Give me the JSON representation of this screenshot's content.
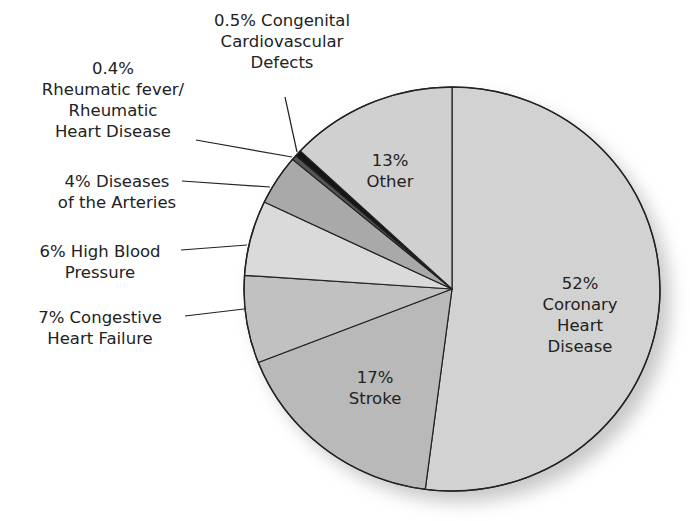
{
  "chart_data": {
    "type": "pie",
    "title": "",
    "start_angle_deg": 0,
    "direction": "clockwise",
    "slices": [
      {
        "label": "Coronary Heart Disease",
        "value": 52,
        "display": "52%",
        "color": "#d2d2d2"
      },
      {
        "label": "Stroke",
        "value": 17,
        "display": "17%",
        "color": "#b9b9b9"
      },
      {
        "label": "Congestive Heart Failure",
        "value": 7,
        "display": "7%",
        "color": "#c1c1c1"
      },
      {
        "label": "High Blood Pressure",
        "value": 6,
        "display": "6%",
        "color": "#dadada"
      },
      {
        "label": "Diseases of the Arteries",
        "value": 4,
        "display": "4%",
        "color": "#a9a9a9"
      },
      {
        "label": "Rheumatic fever/ Rheumatic Heart Disease",
        "value": 0.4,
        "display": "0.4%",
        "color": "#555555"
      },
      {
        "label": "Congenital Cardiovascular Defects",
        "value": 0.5,
        "display": "0.5%",
        "color": "#151515"
      },
      {
        "label": "Other",
        "value": 13,
        "display": "13%",
        "color": "#d0d0d0"
      }
    ]
  },
  "labels": {
    "coronary": [
      "52%",
      "Coronary",
      "Heart",
      "Disease"
    ],
    "stroke": [
      "17%",
      "Stroke"
    ],
    "other": [
      "13%",
      "Other"
    ],
    "chf": [
      "7% Congestive",
      "Heart Failure"
    ],
    "hbp": [
      "6% High Blood",
      "Pressure"
    ],
    "arteries": [
      "4% Diseases",
      "of the Arteries"
    ],
    "rheumatic": [
      "0.4%",
      "Rheumatic fever/",
      "Rheumatic",
      "Heart Disease"
    ],
    "congenital": [
      "0.5% Congenital",
      "Cardiovascular",
      "Defects"
    ]
  }
}
